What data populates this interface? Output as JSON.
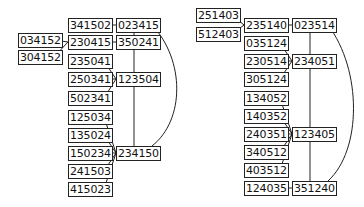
{
  "diagrams": [
    {
      "nodes": [
        {
          "id": "a1",
          "label": "341502",
          "x": 68,
          "y": 18
        },
        {
          "id": "a2",
          "label": "023415",
          "x": 116,
          "y": 18
        },
        {
          "id": "a3",
          "label": "034152",
          "x": 18,
          "y": 33
        },
        {
          "id": "a4",
          "label": "230415",
          "x": 68,
          "y": 35
        },
        {
          "id": "a5",
          "label": "350241",
          "x": 116,
          "y": 35
        },
        {
          "id": "a6",
          "label": "304152",
          "x": 18,
          "y": 50
        },
        {
          "id": "a7",
          "label": "235041",
          "x": 68,
          "y": 54
        },
        {
          "id": "a8",
          "label": "250341",
          "x": 68,
          "y": 72
        },
        {
          "id": "a9",
          "label": "123504",
          "x": 116,
          "y": 72
        },
        {
          "id": "a10",
          "label": "502341",
          "x": 68,
          "y": 91
        },
        {
          "id": "a11",
          "label": "125034",
          "x": 68,
          "y": 110
        },
        {
          "id": "a12",
          "label": "135024",
          "x": 68,
          "y": 128
        },
        {
          "id": "a13",
          "label": "150234",
          "x": 68,
          "y": 146
        },
        {
          "id": "a14",
          "label": "234150",
          "x": 116,
          "y": 146
        },
        {
          "id": "a15",
          "label": "241503",
          "x": 68,
          "y": 164
        },
        {
          "id": "a16",
          "label": "415023",
          "x": 68,
          "y": 182
        }
      ]
    },
    {
      "nodes": [
        {
          "id": "b1",
          "label": "251403",
          "x": 196,
          "y": 8
        },
        {
          "id": "b2",
          "label": "235140",
          "x": 244,
          "y": 18
        },
        {
          "id": "b3",
          "label": "023514",
          "x": 292,
          "y": 18
        },
        {
          "id": "b4",
          "label": "512403",
          "x": 196,
          "y": 27
        },
        {
          "id": "b5",
          "label": "035124",
          "x": 244,
          "y": 36
        },
        {
          "id": "b6",
          "label": "230514",
          "x": 244,
          "y": 54
        },
        {
          "id": "b7",
          "label": "234051",
          "x": 292,
          "y": 54
        },
        {
          "id": "b8",
          "label": "305124",
          "x": 244,
          "y": 72
        },
        {
          "id": "b9",
          "label": "134052",
          "x": 244,
          "y": 91
        },
        {
          "id": "b10",
          "label": "140352",
          "x": 244,
          "y": 109
        },
        {
          "id": "b11",
          "label": "240351",
          "x": 244,
          "y": 127
        },
        {
          "id": "b12",
          "label": "123405",
          "x": 292,
          "y": 127
        },
        {
          "id": "b13",
          "label": "340512",
          "x": 244,
          "y": 145
        },
        {
          "id": "b14",
          "label": "403512",
          "x": 244,
          "y": 163
        },
        {
          "id": "b15",
          "label": "124035",
          "x": 244,
          "y": 181
        },
        {
          "id": "b16",
          "label": "351240",
          "x": 292,
          "y": 181
        }
      ]
    }
  ]
}
